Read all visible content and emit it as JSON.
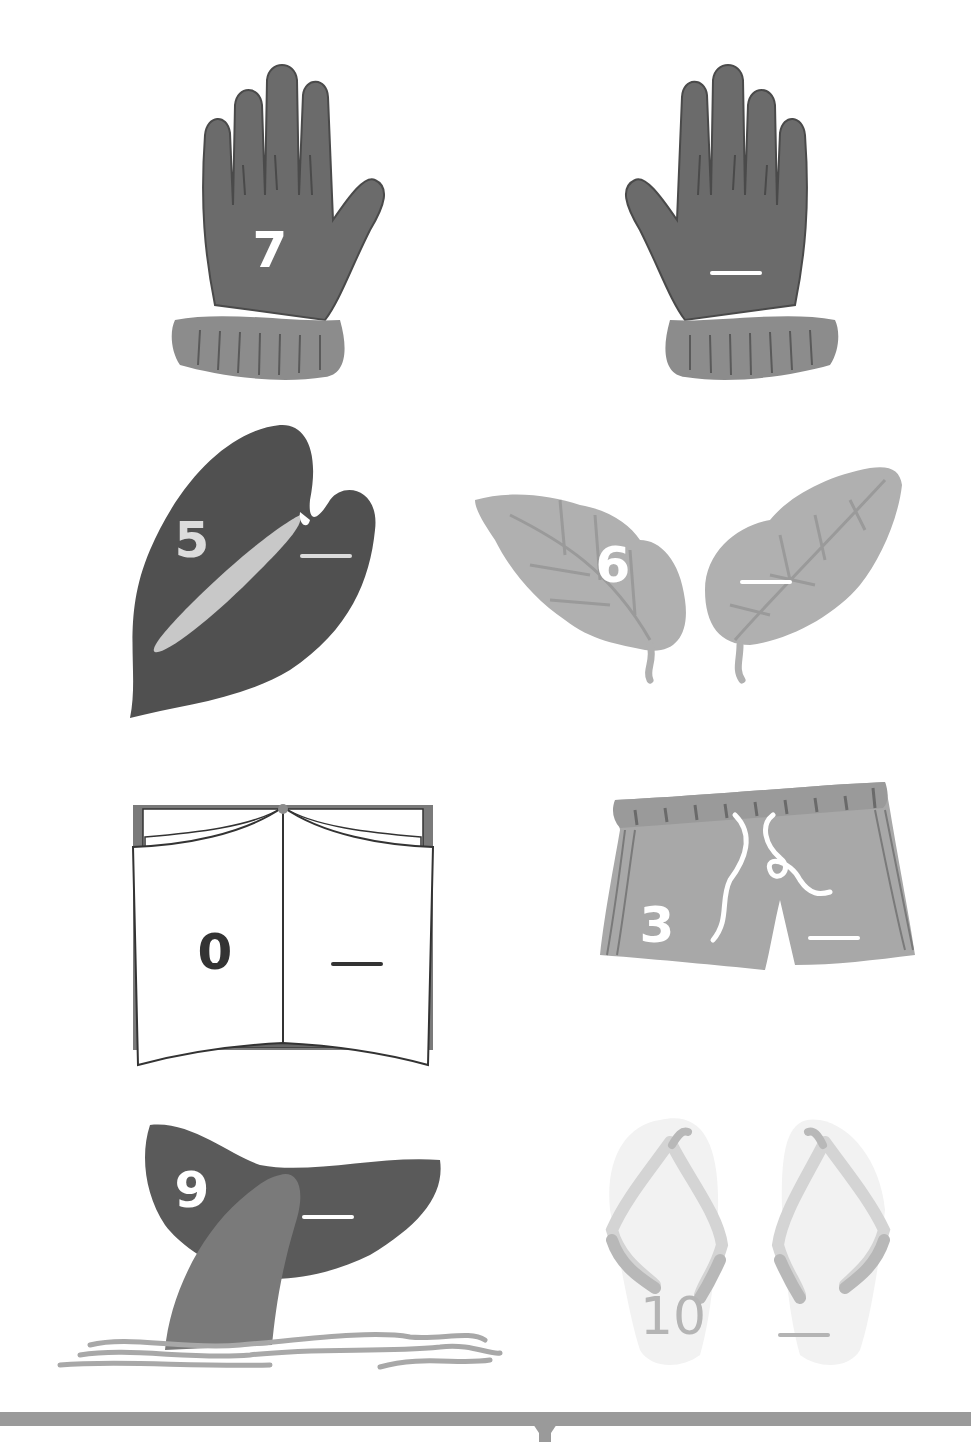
{
  "worksheet": {
    "topic": "make-ten number pairs",
    "blank_symbol": "__",
    "items": [
      {
        "id": "glove-pair",
        "picture": "gloves",
        "given": "7",
        "answer_blank": "__",
        "given_color": "#ffffff",
        "blank_color": "#ffffff"
      },
      {
        "id": "anthurium-leaf",
        "picture": "anthurium-leaf",
        "given": "5",
        "answer_blank": "__",
        "given_color": "#dcdcdc",
        "blank_color": "#dcdcdc"
      },
      {
        "id": "leaf-pair",
        "picture": "leaves",
        "given": "6",
        "answer_blank": "__",
        "given_color": "#ffffff",
        "blank_color": "#ffffff"
      },
      {
        "id": "open-book",
        "picture": "book",
        "given": "0",
        "answer_blank": "__",
        "given_color": "#333333",
        "blank_color": "#333333"
      },
      {
        "id": "shorts",
        "picture": "shorts",
        "given": "3",
        "answer_blank": "__",
        "given_color": "#ffffff",
        "blank_color": "#ffffff"
      },
      {
        "id": "whale-tail",
        "picture": "whale-tail",
        "given": "9",
        "answer_blank": "__",
        "given_color": "#ffffff",
        "blank_color": "#ffffff"
      },
      {
        "id": "flip-flops",
        "picture": "flip-flops",
        "given": "10",
        "answer_blank": "__",
        "given_color": "#b4b4b4",
        "blank_color": "#b4b4b4"
      }
    ]
  },
  "colors": {
    "dark": "#6b6b6b",
    "darker": "#555555",
    "mid": "#8c8c8c",
    "light": "#b0b0b0",
    "pale": "#d6d6d6",
    "bar": "#9a9a9a"
  }
}
